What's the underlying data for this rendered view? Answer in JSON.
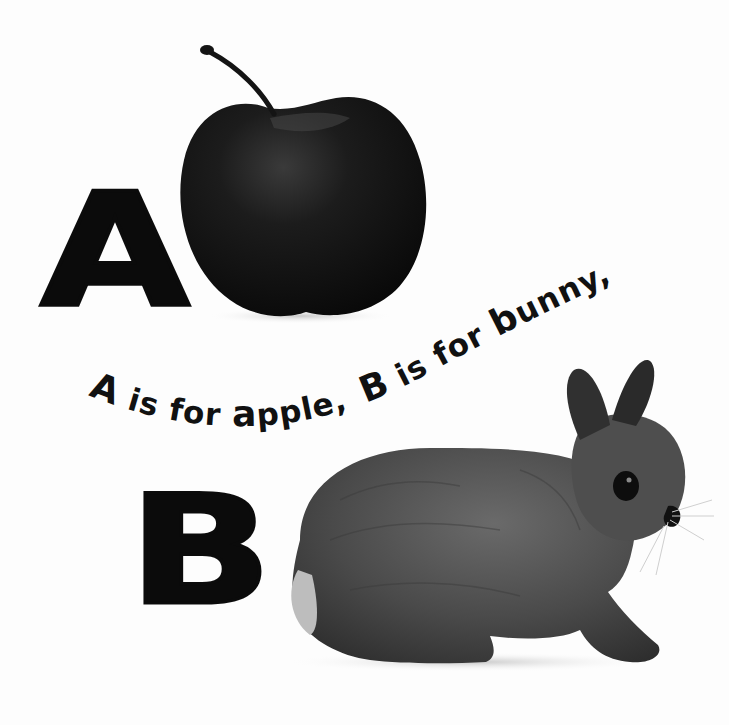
{
  "page": {
    "background": "#fdfdfd",
    "ink_color": "#0b0b0b"
  },
  "letters": {
    "first": "A",
    "second": "B"
  },
  "caption": {
    "part1_initial": "A",
    "part1_rest": " is for ",
    "part1_word_initial": "a",
    "part1_word_rest": "pple,",
    "part2_initial": "B",
    "part2_rest": " is for ",
    "part2_word_initial": "b",
    "part2_word_rest": "unny,"
  },
  "images": {
    "apple": {
      "label": "apple",
      "color": "#161616"
    },
    "bunny": {
      "label": "bunny",
      "color": "#4a4a4a"
    }
  }
}
